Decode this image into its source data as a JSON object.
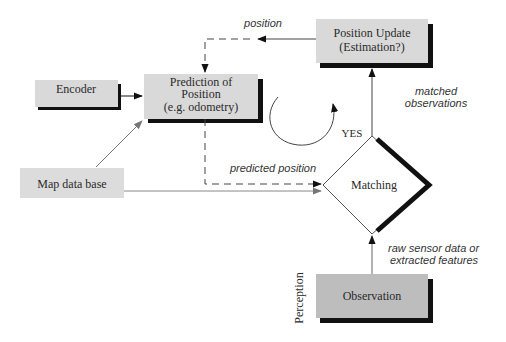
{
  "diagram": {
    "nodes": {
      "position_update": {
        "line1": "Position Update",
        "line2": "(Estimation?)"
      },
      "prediction": {
        "line1": "Prediction of",
        "line2": "Position",
        "line3": "(e.g. odometry)"
      },
      "encoder": {
        "label": "Encoder"
      },
      "map_database": {
        "label": "Map data base"
      },
      "matching": {
        "label": "Matching"
      },
      "observation": {
        "label": "Observation"
      }
    },
    "edge_labels": {
      "position": "position",
      "matched_observations_1": "matched",
      "matched_observations_2": "observations",
      "predicted_position": "predicted position",
      "yes": "YES",
      "raw_sensor_1": "raw sensor data or",
      "raw_sensor_2": "extracted features"
    },
    "side_label": "Perception",
    "colors": {
      "box_fill": "#d9d9d9",
      "observation_fill": "#bdbdbd",
      "shadow": "#111111",
      "line": "#444444",
      "gray_arrow": "#777777"
    }
  }
}
